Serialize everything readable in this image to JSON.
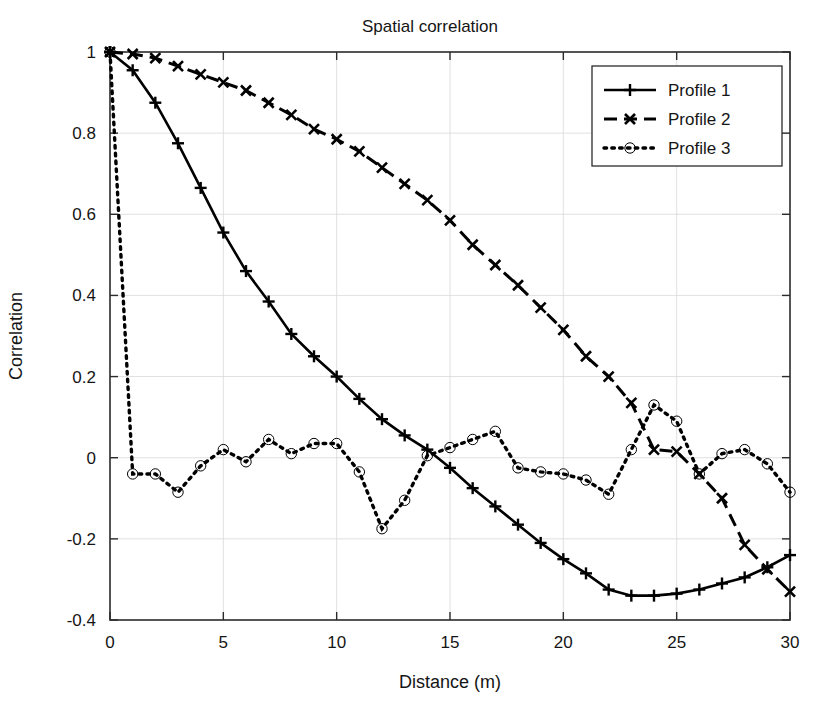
{
  "figure": {
    "title": "Spatial correlation",
    "background_color": "#ffffff",
    "foreground_color": "#000000",
    "grid_color": "#d8d8d8"
  },
  "axes": {
    "x_label": "Distance (m)",
    "y_label": "Correlation",
    "x_ticks": [
      "0",
      "5",
      "10",
      "15",
      "20",
      "25",
      "30"
    ],
    "y_ticks": [
      "-0.4",
      "-0.2",
      "0",
      "0.2",
      "0.4",
      "0.6",
      "0.8",
      "1"
    ]
  },
  "legend": {
    "position": "top-right",
    "items": [
      {
        "label": "Profile 1",
        "style": "solid",
        "marker": "plus"
      },
      {
        "label": "Profile 2",
        "style": "dashed",
        "marker": "cross"
      },
      {
        "label": "Profile 3",
        "style": "dotted",
        "marker": "circle"
      }
    ]
  },
  "chart_data": {
    "type": "line",
    "title": "Spatial correlation",
    "xlabel": "Distance (m)",
    "ylabel": "Correlation",
    "xlim": [
      0,
      30
    ],
    "ylim": [
      -0.4,
      1.0
    ],
    "x_ticks": [
      0,
      5,
      10,
      15,
      20,
      25,
      30
    ],
    "y_ticks": [
      -0.4,
      -0.2,
      0,
      0.2,
      0.4,
      0.6,
      0.8,
      1
    ],
    "grid": true,
    "legend_position": "top-right",
    "x": [
      0,
      1,
      2,
      3,
      4,
      5,
      6,
      7,
      8,
      9,
      10,
      11,
      12,
      13,
      14,
      15,
      16,
      17,
      18,
      19,
      20,
      21,
      22,
      23,
      24,
      25,
      26,
      27,
      28,
      29,
      30
    ],
    "series": [
      {
        "name": "Profile 1",
        "style": "solid",
        "marker": "plus",
        "color": "#000000",
        "values": [
          1.0,
          0.955,
          0.875,
          0.775,
          0.665,
          0.555,
          0.46,
          0.385,
          0.305,
          0.25,
          0.2,
          0.145,
          0.095,
          0.055,
          0.02,
          -0.025,
          -0.075,
          -0.12,
          -0.165,
          -0.21,
          -0.25,
          -0.285,
          -0.325,
          -0.34,
          -0.34,
          -0.335,
          -0.325,
          -0.31,
          -0.295,
          -0.27,
          -0.24
        ]
      },
      {
        "name": "Profile 2",
        "style": "dashed",
        "marker": "cross",
        "color": "#000000",
        "values": [
          1.0,
          0.995,
          0.985,
          0.965,
          0.945,
          0.925,
          0.905,
          0.875,
          0.845,
          0.81,
          0.785,
          0.755,
          0.715,
          0.675,
          0.635,
          0.585,
          0.525,
          0.475,
          0.425,
          0.37,
          0.315,
          0.25,
          0.2,
          0.135,
          0.02,
          0.015,
          -0.04,
          -0.1,
          -0.215,
          -0.275,
          -0.33
        ]
      },
      {
        "name": "Profile 3",
        "style": "dotted",
        "marker": "circle",
        "color": "#000000",
        "values": [
          1.0,
          -0.04,
          -0.04,
          -0.085,
          -0.02,
          0.02,
          -0.01,
          0.045,
          0.01,
          0.035,
          0.035,
          -0.035,
          -0.175,
          -0.105,
          0.005,
          0.025,
          0.045,
          0.065,
          -0.025,
          -0.035,
          -0.04,
          -0.055,
          -0.09,
          0.02,
          0.13,
          0.09,
          -0.04,
          0.01,
          0.02,
          -0.015,
          -0.085
        ]
      }
    ]
  }
}
